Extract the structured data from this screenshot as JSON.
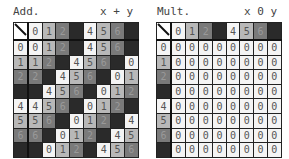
{
  "add": {
    "title": "Add.",
    "op": "x + y",
    "header": [
      0,
      1,
      2,
      3,
      4,
      5,
      6,
      7
    ],
    "rows": [
      [
        0,
        1,
        2,
        3,
        4,
        5,
        6,
        7
      ],
      [
        1,
        2,
        3,
        4,
        5,
        6,
        7,
        0
      ],
      [
        2,
        3,
        4,
        5,
        6,
        7,
        0,
        1
      ],
      [
        3,
        4,
        5,
        6,
        7,
        0,
        1,
        2
      ],
      [
        4,
        5,
        6,
        7,
        0,
        1,
        2,
        3
      ],
      [
        5,
        6,
        7,
        0,
        1,
        2,
        3,
        4
      ],
      [
        6,
        7,
        0,
        1,
        2,
        3,
        4,
        5
      ],
      [
        7,
        0,
        1,
        2,
        3,
        4,
        5,
        6
      ]
    ]
  },
  "mult": {
    "title": "Mult.",
    "op": "x 0 y",
    "header": [
      0,
      1,
      2,
      3,
      4,
      5,
      6,
      7
    ],
    "rows": [
      [
        0,
        0,
        0,
        0,
        0,
        0,
        0,
        0
      ],
      [
        0,
        0,
        0,
        0,
        0,
        0,
        0,
        0
      ],
      [
        0,
        0,
        0,
        0,
        0,
        0,
        0,
        0
      ],
      [
        0,
        0,
        0,
        0,
        0,
        0,
        0,
        0
      ],
      [
        0,
        0,
        0,
        0,
        0,
        0,
        0,
        0
      ],
      [
        0,
        0,
        0,
        0,
        0,
        0,
        0,
        0
      ],
      [
        0,
        0,
        0,
        0,
        0,
        0,
        0,
        0
      ],
      [
        0,
        0,
        0,
        0,
        0,
        0,
        0,
        0
      ]
    ]
  }
}
